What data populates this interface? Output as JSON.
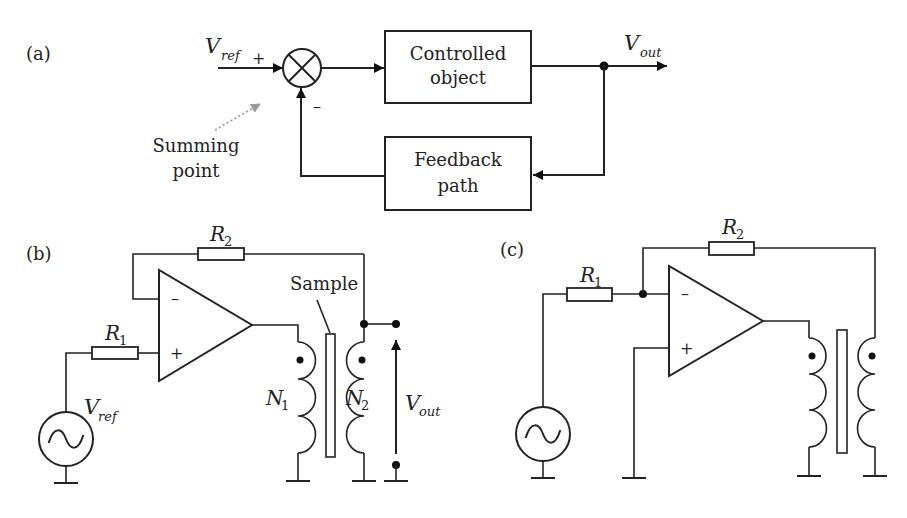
{
  "panel_a": {
    "label": "(a)",
    "input": {
      "symbol": "V",
      "subscript": "ref",
      "sign": "+"
    },
    "summing_sign_feedback": "–",
    "summing_point_label": [
      "Summing",
      "point"
    ],
    "blocks": {
      "forward": [
        "Controlled",
        "object"
      ],
      "feedback": [
        "Feedback",
        "path"
      ]
    },
    "output": {
      "symbol": "V",
      "subscript": "out"
    }
  },
  "panel_b": {
    "label": "(b)",
    "R1": {
      "symbol": "R",
      "subscript": "1"
    },
    "R2": {
      "symbol": "R",
      "subscript": "2"
    },
    "opamp": {
      "minus": "–",
      "plus": "+"
    },
    "source": {
      "symbol": "V",
      "subscript": "ref"
    },
    "primary": {
      "symbol": "N",
      "subscript": "1"
    },
    "secondary": {
      "symbol": "N",
      "subscript": "2"
    },
    "sample_label": "Sample",
    "output": {
      "symbol": "V",
      "subscript": "out"
    }
  },
  "panel_c": {
    "label": "(c)",
    "R1": {
      "symbol": "R",
      "subscript": "1"
    },
    "R2": {
      "symbol": "R",
      "subscript": "2"
    },
    "opamp": {
      "minus": "–",
      "plus": "+"
    }
  },
  "colors": {
    "line": "#222222",
    "pointer": "#9a9a9a",
    "background": "#ffffff"
  }
}
